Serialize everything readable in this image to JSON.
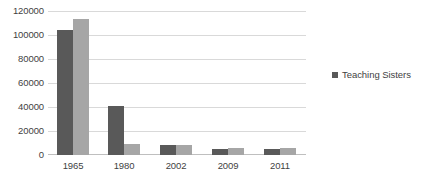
{
  "chart_data": {
    "type": "bar",
    "title": "",
    "subtitle": "",
    "xlabel": "",
    "ylabel": "",
    "categories": [
      "1965",
      "1980",
      "2002",
      "2009",
      "2011"
    ],
    "series": [
      {
        "name": "Teaching Sisters",
        "color": "#595959",
        "values": [
          104000,
          40500,
          8500,
          5200,
          5000
        ]
      },
      {
        "name": "",
        "color": "#a6a6a6",
        "values": [
          113000,
          9500,
          8200,
          5500,
          6000
        ]
      }
    ],
    "ylim": [
      0,
      120000
    ],
    "ytick_step": 20000,
    "yticks": [
      0,
      20000,
      40000,
      60000,
      80000,
      100000,
      120000
    ],
    "ytick_labels": [
      "0",
      "20000",
      "40000",
      "60000",
      "80000",
      "100000",
      "120000"
    ],
    "grid": true,
    "grid_axis": "y",
    "legend_position": "right",
    "legend": [
      {
        "label": "Teaching Sisters",
        "color": "#595959",
        "marker": "square-marker"
      }
    ],
    "colors": {
      "series_dark": "#595959",
      "series_light": "#a6a6a6",
      "gridline": "#d9d9d9",
      "axis_line": "#bfbfbf",
      "text": "#3f3f3f",
      "background": "#ffffff"
    }
  }
}
